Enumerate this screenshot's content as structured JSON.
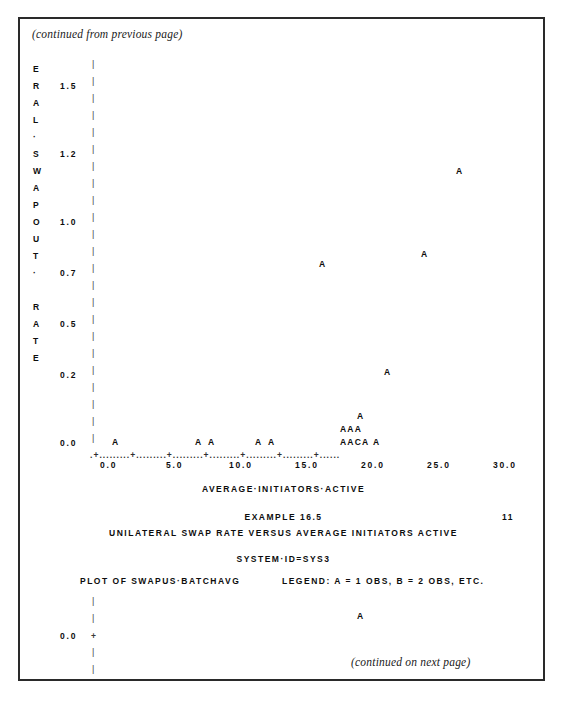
{
  "page": {
    "continued_from": "(continued from previous page)",
    "continued_to": "(continued on next page)",
    "page_number": "11"
  },
  "captions": {
    "xlabel": "AVERAGE·INITIATORS·ACTIVE",
    "example": "EXAMPLE 16.5",
    "title": "UNILATERAL SWAP RATE VERSUS AVERAGE INITIATORS ACTIVE",
    "system": "SYSTEM·ID=SYS3",
    "plot_of": "PLOT OF SWAPUS·BATCHAVG",
    "legend": "LEGEND: A = 1 OBS, B = 2 OBS, ETC."
  },
  "ylabel_letters": [
    {
      "char": "E",
      "y": 46
    },
    {
      "char": "R",
      "y": 63
    },
    {
      "char": "A",
      "y": 80
    },
    {
      "char": "L",
      "y": 97
    },
    {
      "char": "·",
      "y": 114
    },
    {
      "char": "S",
      "y": 131
    },
    {
      "char": "W",
      "y": 148
    },
    {
      "char": "A",
      "y": 165
    },
    {
      "char": "P",
      "y": 182
    },
    {
      "char": "O",
      "y": 199
    },
    {
      "char": "U",
      "y": 216
    },
    {
      "char": "T",
      "y": 233
    },
    {
      "char": "·",
      "y": 250
    },
    {
      "char": "R",
      "y": 284
    },
    {
      "char": "A",
      "y": 301
    },
    {
      "char": "T",
      "y": 318
    },
    {
      "char": "E",
      "y": 335
    }
  ],
  "ylabel_text": "LATERAL·SWAP·OUT·RATE",
  "chart_data": {
    "type": "scatter",
    "title": "UNILATERAL SWAP RATE VERSUS AVERAGE INITIATORS ACTIVE",
    "subtitle": "EXAMPLE 16.5",
    "xlabel": "AVERAGE·INITIATORS·ACTIVE",
    "ylabel": "UNILATERAL·SWAP·OUT·RATE",
    "legend": "A = 1 OBS, B = 2 OBS, ETC.",
    "plot_variables": "SWAPUS·BATCHAVG",
    "grid": false,
    "xlim": [
      0.0,
      32.0
    ],
    "ylim": [
      0.0,
      1.6
    ],
    "xticks": [
      "0.0",
      "5.0",
      "10.0",
      "15.0",
      "20.0",
      "25.0",
      "30.0"
    ],
    "xtick_values": [
      0.0,
      5.0,
      10.0,
      15.0,
      20.0,
      25.0,
      30.0
    ],
    "yticks": [
      "1.5",
      "1.2",
      "1.0",
      "0.7",
      "0.5",
      "0.2",
      "0.0"
    ],
    "ytick_values": [
      1.5,
      1.2,
      1.0,
      0.7,
      0.5,
      0.2,
      0.0
    ],
    "points": [
      {
        "symbol": "A",
        "x": 26.3,
        "y": 1.14,
        "count": 1
      },
      {
        "symbol": "A",
        "x": 23.7,
        "y": 0.78,
        "count": 1
      },
      {
        "symbol": "A",
        "x": 18.2,
        "y": 0.7,
        "count": 1
      },
      {
        "symbol": "A",
        "x": 20.1,
        "y": 0.24,
        "count": 1
      },
      {
        "symbol": "A",
        "x": 19.2,
        "y": 0.06,
        "count": 1
      },
      {
        "symbol": "A",
        "x": 17.3,
        "y": 0.03,
        "count": 1
      },
      {
        "symbol": "A",
        "x": 17.8,
        "y": 0.03,
        "count": 1
      },
      {
        "symbol": "A",
        "x": 18.3,
        "y": 0.03,
        "count": 1
      },
      {
        "symbol": "A",
        "x": 2.3,
        "y": 0.0,
        "count": 1
      },
      {
        "symbol": "A",
        "x": 8.6,
        "y": 0.0,
        "count": 1
      },
      {
        "symbol": "A",
        "x": 9.6,
        "y": 0.0,
        "count": 1
      },
      {
        "symbol": "A",
        "x": 13.2,
        "y": 0.0,
        "count": 1
      },
      {
        "symbol": "A",
        "x": 14.2,
        "y": 0.0,
        "count": 1
      },
      {
        "symbol": "A",
        "x": 16.1,
        "y": 0.0,
        "count": 1
      },
      {
        "symbol": "A",
        "x": 16.6,
        "y": 0.0,
        "count": 1
      },
      {
        "symbol": "C",
        "x": 17.1,
        "y": 0.0,
        "count": 3
      },
      {
        "symbol": "A",
        "x": 17.6,
        "y": 0.0,
        "count": 1
      },
      {
        "symbol": "A",
        "x": 20.6,
        "y": 0.0,
        "count": 1
      }
    ],
    "lower_panel_points": [
      {
        "symbol": "A",
        "x": 20.0,
        "y": 0.1,
        "count": 1
      }
    ],
    "lower_panel_ytick": "0.0"
  },
  "colors": {
    "frame": "#2a2a2a",
    "text": "#0d0d0d",
    "axis": "#3a3a3a",
    "background": "#ffffff"
  },
  "markers": {
    "m_top_right": "A",
    "m_mid_right": "A",
    "m_mid_left": "A",
    "m_low_mid": "A",
    "m_above_cluster": "A",
    "m_cluster_top": "AAA",
    "m_cluster_bot": "AACA",
    "m_base_1": "A",
    "m_base_2": "A",
    "m_base_3": "A",
    "m_base_4": "A",
    "m_base_5": "A",
    "m_base_6": "A",
    "m_base_7": "A",
    "m_lower_panel": "A"
  },
  "yaxis_ticks": [
    {
      "label": "1.5",
      "y": 63
    },
    {
      "label": "1.2",
      "y": 131
    },
    {
      "label": "1.0",
      "y": 199
    },
    {
      "label": "0.7",
      "y": 250
    },
    {
      "label": "0.5",
      "y": 301
    },
    {
      "label": "0.2",
      "y": 352
    },
    {
      "label": "0.0",
      "y": 420
    }
  ],
  "xaxis": {
    "line": ".+.........+.........+.........+.........+.........+.........+......",
    "labels": [
      {
        "label": "0.0",
        "x": 80
      },
      {
        "label": "5.0",
        "x": 146
      },
      {
        "label": "10.0",
        "x": 209
      },
      {
        "label": "15.0",
        "x": 275
      },
      {
        "label": "20.0",
        "x": 341
      },
      {
        "label": "25.0",
        "x": 407
      },
      {
        "label": "30.0",
        "x": 473
      }
    ]
  }
}
